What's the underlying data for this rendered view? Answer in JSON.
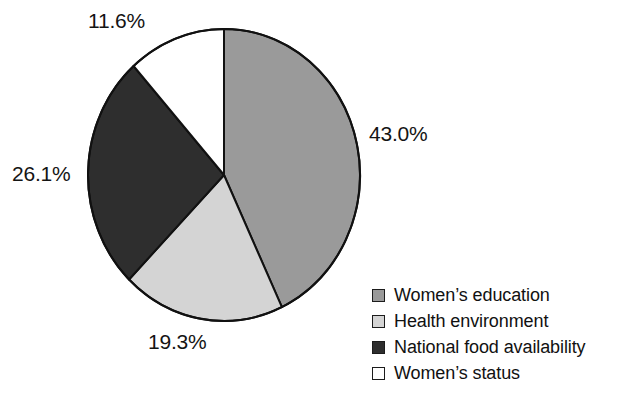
{
  "chart_data": {
    "type": "pie",
    "title": "",
    "subtitle": "",
    "xlabel": "",
    "ylabel": "",
    "grid": false,
    "legend_position": "bottom-right",
    "start_angle_deg": 0,
    "direction": "clockwise",
    "categories": [
      "Women’s education",
      "Health environment",
      "National food availability",
      "Women’s status"
    ],
    "values": [
      43.0,
      19.3,
      26.1,
      11.6
    ],
    "value_labels": [
      "43.0%",
      "19.3%",
      "26.1%",
      "11.6%"
    ],
    "colors": [
      "#9a9a9a",
      "#d4d4d4",
      "#2e2e2e",
      "#ffffff"
    ],
    "slice_outline_color": "#111111",
    "slices": [
      {
        "name": "Women’s education",
        "value": 43.0,
        "label": "43.0%",
        "color": "#9a9a9a",
        "start_deg": 0.0,
        "end_deg": 154.8
      },
      {
        "name": "Health environment",
        "value": 19.3,
        "label": "19.3%",
        "color": "#d4d4d4",
        "start_deg": 154.8,
        "end_deg": 224.3
      },
      {
        "name": "National food availability",
        "value": 26.1,
        "label": "26.1%",
        "color": "#2e2e2e",
        "start_deg": 224.3,
        "end_deg": 318.3
      },
      {
        "name": "Women’s status",
        "value": 11.6,
        "label": "11.6%",
        "color": "#ffffff",
        "start_deg": 318.3,
        "end_deg": 360.0
      }
    ]
  },
  "labels": {
    "women_education": "43.0%",
    "health_environment": "19.3%",
    "national_food": "26.1%",
    "women_status": "11.6%"
  },
  "legend": {
    "items": [
      {
        "label": "Women’s education",
        "color": "#9a9a9a"
      },
      {
        "label": "Health environment",
        "color": "#d4d4d4"
      },
      {
        "label": "National food availability",
        "color": "#2e2e2e"
      },
      {
        "label": "Women’s status",
        "color": "#ffffff"
      }
    ]
  }
}
